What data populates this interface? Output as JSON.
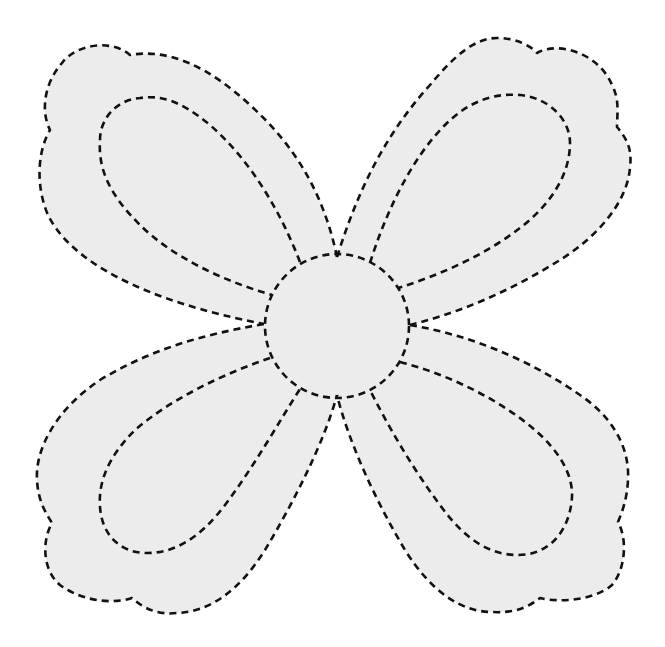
{
  "illustration": {
    "subject": "Four-petal flower dashed-line tracing outline",
    "colors": {
      "background": "#ffffff",
      "fill": "#ececec",
      "line": "#111111"
    },
    "line_style": "dashed",
    "parts": {
      "petals": [
        "top-left",
        "top-right",
        "bottom-left",
        "bottom-right"
      ],
      "center": "circle"
    }
  }
}
